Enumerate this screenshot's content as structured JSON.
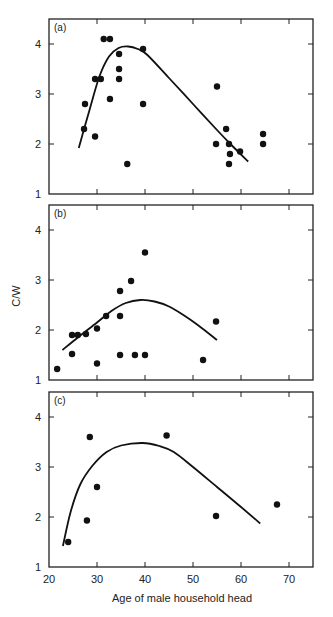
{
  "chart_data": {
    "type": "scatter",
    "xlabel": "Age of male household head",
    "ylabel": "C/W",
    "xlim": [
      20,
      75
    ],
    "ylim": [
      1,
      4.5
    ],
    "xticks": [
      20,
      30,
      40,
      50,
      60,
      70
    ],
    "yticks": [
      1,
      2,
      3,
      4
    ],
    "grid": false,
    "panels": [
      {
        "label": "(a)",
        "points": [
          [
            27.3,
            2.3
          ],
          [
            27.5,
            2.8
          ],
          [
            29.6,
            2.15
          ],
          [
            29.6,
            3.3
          ],
          [
            30.8,
            3.3
          ],
          [
            31.4,
            4.1
          ],
          [
            32.7,
            4.1
          ],
          [
            32.7,
            2.9
          ],
          [
            34.6,
            3.8
          ],
          [
            34.6,
            3.5
          ],
          [
            34.6,
            3.3
          ],
          [
            36.3,
            1.6
          ],
          [
            39.6,
            3.9
          ],
          [
            39.6,
            2.8
          ],
          [
            55.0,
            3.15
          ],
          [
            56.9,
            2.3
          ],
          [
            54.8,
            2.0
          ],
          [
            57.5,
            2.0
          ],
          [
            57.7,
            1.8
          ],
          [
            57.5,
            1.6
          ],
          [
            59.8,
            1.85
          ],
          [
            64.6,
            2.2
          ],
          [
            64.6,
            2.0
          ]
        ],
        "curve": [
          [
            26.2,
            1.92
          ],
          [
            28.5,
            2.7
          ],
          [
            30.5,
            3.35
          ],
          [
            32.5,
            3.75
          ],
          [
            34.5,
            3.92
          ],
          [
            36.5,
            3.95
          ],
          [
            38.5,
            3.9
          ],
          [
            40.5,
            3.78
          ],
          [
            45,
            3.32
          ],
          [
            50,
            2.8
          ],
          [
            55,
            2.28
          ],
          [
            58,
            1.98
          ],
          [
            61.5,
            1.65
          ]
        ]
      },
      {
        "label": "(b)",
        "points": [
          [
            21.7,
            1.22
          ],
          [
            24.8,
            1.9
          ],
          [
            24.8,
            1.52
          ],
          [
            26.0,
            1.9
          ],
          [
            27.7,
            1.92
          ],
          [
            30.0,
            2.03
          ],
          [
            30.0,
            1.33
          ],
          [
            31.9,
            2.28
          ],
          [
            34.8,
            2.78
          ],
          [
            34.8,
            2.28
          ],
          [
            34.8,
            1.5
          ],
          [
            37.1,
            2.98
          ],
          [
            37.9,
            1.5
          ],
          [
            40.0,
            3.55
          ],
          [
            40.0,
            1.5
          ],
          [
            52.1,
            1.4
          ],
          [
            54.8,
            2.17
          ]
        ],
        "curve": [
          [
            22.8,
            1.6
          ],
          [
            26,
            1.85
          ],
          [
            30,
            2.15
          ],
          [
            33,
            2.38
          ],
          [
            36,
            2.54
          ],
          [
            39,
            2.6
          ],
          [
            42,
            2.57
          ],
          [
            45,
            2.47
          ],
          [
            48,
            2.3
          ],
          [
            51,
            2.1
          ],
          [
            55,
            1.8
          ]
        ]
      },
      {
        "label": "(c)",
        "points": [
          [
            24.0,
            1.5
          ],
          [
            27.9,
            1.93
          ],
          [
            28.5,
            3.6
          ],
          [
            30.0,
            2.6
          ],
          [
            44.5,
            3.63
          ],
          [
            54.8,
            2.02
          ],
          [
            67.5,
            2.25
          ]
        ],
        "curve": [
          [
            22.9,
            1.42
          ],
          [
            24.5,
            2.1
          ],
          [
            26.5,
            2.65
          ],
          [
            29,
            3.02
          ],
          [
            32,
            3.3
          ],
          [
            35,
            3.43
          ],
          [
            39.5,
            3.48
          ],
          [
            43,
            3.42
          ],
          [
            46,
            3.3
          ],
          [
            50,
            3.0
          ],
          [
            55,
            2.6
          ],
          [
            60,
            2.2
          ],
          [
            64,
            1.87
          ]
        ]
      }
    ]
  }
}
